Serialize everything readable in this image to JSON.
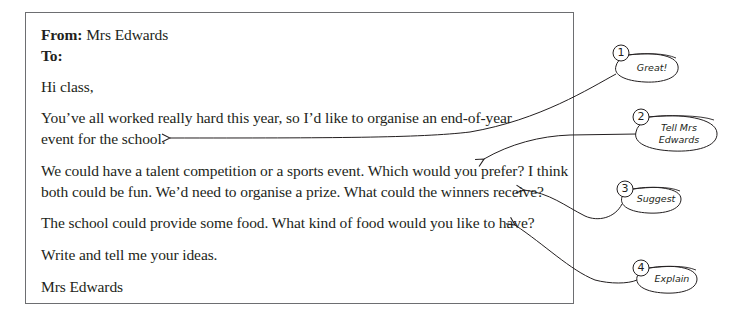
{
  "letter": {
    "from_label": "From:",
    "from_value": "Mrs Edwards",
    "to_label": "To:",
    "to_value": "",
    "greeting": "Hi class,",
    "paragraphs": [
      {
        "lines": [
          "You’ve all worked really hard this year, so I’d like to organise an end-of-year",
          "event for the school."
        ]
      },
      {
        "lines": [
          "We could have a talent competition or a sports event. Which would you prefer? I think",
          "both could be fun. We’d need to organise a prize. What could the winners receive?"
        ]
      },
      {
        "lines": [
          "The school could provide some food. What kind of food would you like to have?"
        ]
      },
      {
        "lines": [
          "Write and tell me your ideas."
        ]
      }
    ],
    "signature": "Mrs Edwards"
  },
  "callouts": [
    {
      "number": "1",
      "label": "Great!"
    },
    {
      "number": "2",
      "label_line1": "Tell Mrs",
      "label_line2": "Edwards"
    },
    {
      "number": "3",
      "label": "Suggest"
    },
    {
      "number": "4",
      "label": "Explain"
    }
  ],
  "colors": {
    "text": "#231f20",
    "border": "#6d6e71",
    "background": "#ffffff"
  }
}
